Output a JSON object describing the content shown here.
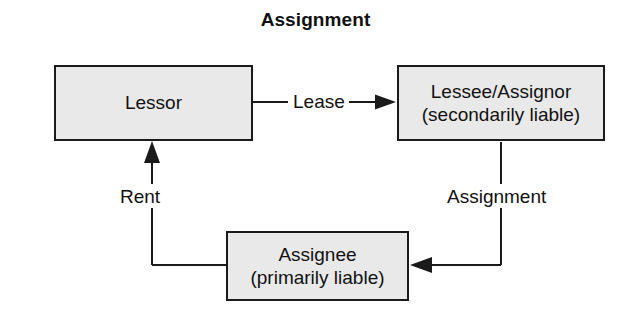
{
  "diagram": {
    "title": "Assignment",
    "type": "flow-diagram",
    "background_color": "#ffffff",
    "node_fill_color": "#e9e9e9",
    "node_border_color": "#1a1a1a",
    "text_color": "#111111",
    "nodes": [
      {
        "id": "lessor",
        "lines": [
          "Lessor"
        ],
        "line1": "Lessor",
        "line2": ""
      },
      {
        "id": "lessee-assignor",
        "lines": [
          "Lessee/Assignor",
          "(secondarily liable)"
        ],
        "line1": "Lessee/Assignor",
        "line2": "(secondarily liable)"
      },
      {
        "id": "assignee",
        "lines": [
          "Assignee",
          "(primarily liable)"
        ],
        "line1": "Assignee",
        "line2": "(primarily liable)"
      }
    ],
    "edges": [
      {
        "id": "lease",
        "label": "Lease",
        "from": "lessor",
        "to": "lessee-assignor",
        "direction": "right"
      },
      {
        "id": "assignment",
        "label": "Assignment",
        "from": "lessee-assignor",
        "to": "assignee",
        "direction": "left"
      },
      {
        "id": "rent",
        "label": "Rent",
        "from": "assignee",
        "to": "lessor",
        "direction": "up"
      }
    ]
  }
}
